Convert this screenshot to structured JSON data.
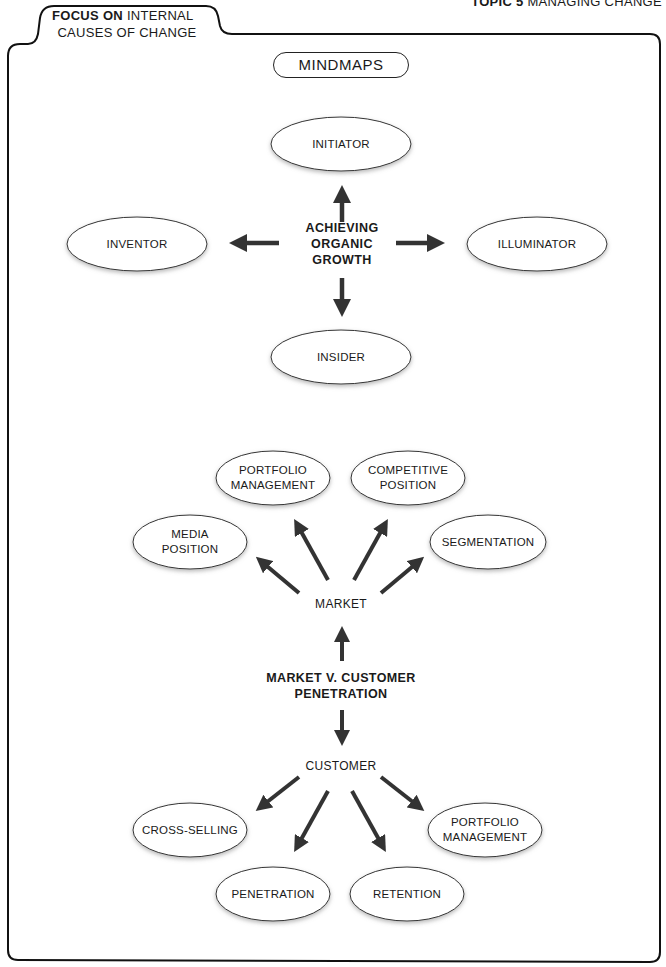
{
  "header": {
    "topic_bold": "TOPIC 5",
    "topic_rest": " MANAGING CHANGE",
    "focus_bold": "FOCUS ON",
    "focus_rest": " INTERNAL",
    "focus_line2": "CAUSES OF CHANGE"
  },
  "title_pill": "MINDMAPS",
  "colors": {
    "line": "#222222",
    "arrow": "#333333",
    "ellipse_fill": "#ffffff",
    "ellipse_shadow": "#999999"
  },
  "mindmap1": {
    "center": [
      "ACHIEVING",
      "ORGANIC",
      "GROWTH"
    ],
    "nodes": {
      "top": "INITIATOR",
      "left": "INVENTOR",
      "right": "ILLUMINATOR",
      "bottom": "INSIDER"
    }
  },
  "mindmap2": {
    "center": [
      "MARKET V. CUSTOMER",
      "PENETRATION"
    ],
    "market": {
      "label": "MARKET",
      "nodes": [
        [
          "MEDIA",
          "POSITION"
        ],
        [
          "PORTFOLIO",
          "MANAGEMENT"
        ],
        [
          "COMPETITIVE",
          "POSITION"
        ],
        [
          "SEGMENTATION"
        ]
      ]
    },
    "customer": {
      "label": "CUSTOMER",
      "nodes": [
        [
          "CROSS-SELLING"
        ],
        [
          "PENETRATION"
        ],
        [
          "RETENTION"
        ],
        [
          "PORTFOLIO",
          "MANAGEMENT"
        ]
      ]
    }
  }
}
